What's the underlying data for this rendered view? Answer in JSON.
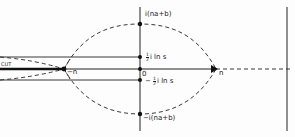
{
  "diagram": {
    "type": "complex-plane contour diagram",
    "colors": {
      "line": "#222222",
      "background": "#fdfdfd"
    },
    "labels": {
      "top": "i(na+b)",
      "half_pos_coef": "1",
      "half_pos_den": "2",
      "half_pos_rest": "i ln s",
      "origin": "0",
      "half_neg_sign": "−",
      "half_neg_coef": "1",
      "half_neg_den": "2",
      "half_neg_rest": "i ln s",
      "bottom": "−i(na+b)",
      "neg_n": "−n",
      "pos_n": "n",
      "cut": "CUT"
    },
    "points": [
      {
        "name": "i(na+b)",
        "x": 140,
        "y": 24
      },
      {
        "name": "½ i ln s",
        "x": 140,
        "y": 57
      },
      {
        "name": "0",
        "x": 140,
        "y": 69
      },
      {
        "name": "−½ i ln s",
        "x": 140,
        "y": 80
      },
      {
        "name": "−i(na+b)",
        "x": 140,
        "y": 114
      },
      {
        "name": "−n",
        "x": 64,
        "y": 69
      },
      {
        "name": "n",
        "x": 216,
        "y": 69
      }
    ]
  }
}
